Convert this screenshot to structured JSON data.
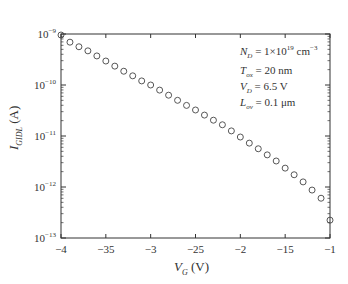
{
  "chart_data": {
    "type": "scatter",
    "title": "",
    "xlabel": "V_G (V)",
    "ylabel": "I_GIDL (A)",
    "xlim": [
      -4,
      -1
    ],
    "ylim": [
      1e-13,
      1e-09
    ],
    "yscale": "log",
    "grid": false,
    "legend": null,
    "x_tick_labels": [
      "-4",
      "-35",
      "-3",
      "-25",
      "-2",
      "-15",
      "-1"
    ],
    "y_tick_labels": [
      "10^-9",
      "10^-10",
      "10^-11",
      "10^-12",
      "10^-13"
    ],
    "marker": "open-circle",
    "series": [
      {
        "name": "I_GIDL",
        "x": [
          -4.0,
          -3.9,
          -3.8,
          -3.7,
          -3.6,
          -3.5,
          -3.4,
          -3.3,
          -3.2,
          -3.1,
          -3.0,
          -2.9,
          -2.8,
          -2.7,
          -2.6,
          -2.5,
          -2.4,
          -2.3,
          -2.2,
          -2.1,
          -2.0,
          -1.9,
          -1.8,
          -1.7,
          -1.6,
          -1.5,
          -1.4,
          -1.3,
          -1.2,
          -1.1,
          -1.0
        ],
        "log10_y": [
          -9.02,
          -9.16,
          -9.25,
          -9.33,
          -9.43,
          -9.53,
          -9.63,
          -9.73,
          -9.82,
          -9.92,
          -10.0,
          -10.1,
          -10.2,
          -10.3,
          -10.4,
          -10.49,
          -10.59,
          -10.69,
          -10.78,
          -10.9,
          -11.02,
          -11.14,
          -11.25,
          -11.37,
          -11.49,
          -11.63,
          -11.76,
          -11.9,
          -12.06,
          -12.22,
          -12.65
        ]
      }
    ],
    "annotations": [
      "N_D = 1×10^19 cm^-3",
      "T_ox = 20 nm",
      "V_D = 6.5 V",
      "L_ov = 0.1 μm"
    ]
  },
  "labels": {
    "xlabel_main": "V",
    "xlabel_sub": "G",
    "xlabel_unit": " (V)",
    "ylabel_main": "I",
    "ylabel_sub": "GIDL",
    "ylabel_unit": " (A)",
    "ann1_main": "N",
    "ann1_sub": "D",
    "ann1_rest": " = 1×10",
    "ann1_exp": "19",
    "ann1_unit": " cm",
    "ann1_unit_exp": "−3",
    "ann2_main": "T",
    "ann2_sub": "ox",
    "ann2_rest": " = 20 nm",
    "ann3_main": "V",
    "ann3_sub": "D",
    "ann3_rest": " = 6.5 V",
    "ann4_main": "L",
    "ann4_sub": "ov",
    "ann4_rest": " = 0.1 μm"
  }
}
